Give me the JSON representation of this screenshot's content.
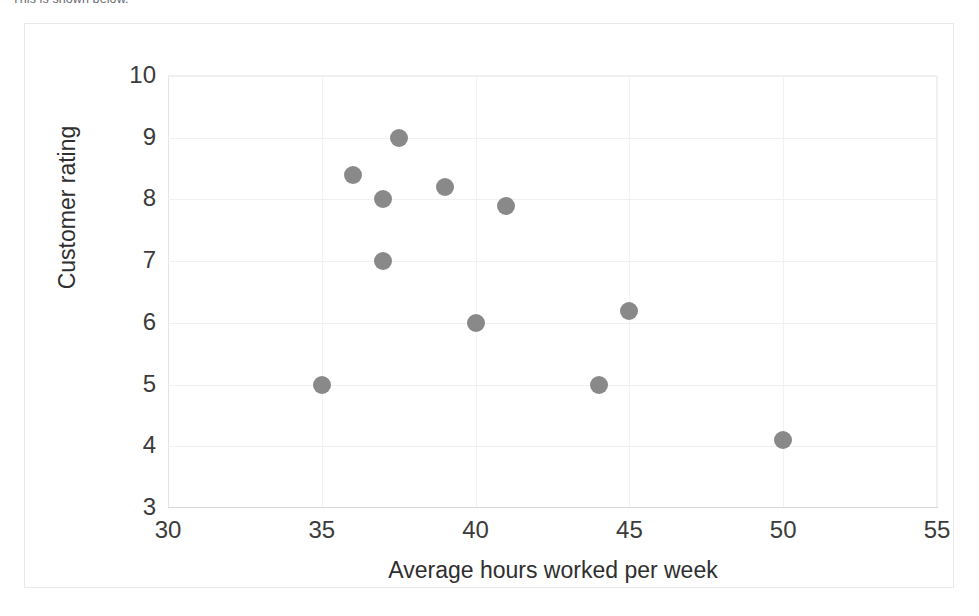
{
  "page": {
    "top_caption": "This is shown below."
  },
  "chart_data": {
    "type": "scatter",
    "title": "",
    "xlabel": "Average hours worked per week",
    "ylabel": "Customer rating",
    "xlim": [
      30,
      55
    ],
    "ylim": [
      3,
      10
    ],
    "xticks": [
      30,
      35,
      40,
      45,
      50,
      55
    ],
    "yticks": [
      3,
      4,
      5,
      6,
      7,
      8,
      9,
      10
    ],
    "grid": true,
    "legend": false,
    "marker_color": "#7f7f7f",
    "series": [
      {
        "name": "Employees",
        "points": [
          {
            "x": 35,
            "y": 5.0
          },
          {
            "x": 36,
            "y": 8.4
          },
          {
            "x": 37,
            "y": 8.0
          },
          {
            "x": 37,
            "y": 7.0
          },
          {
            "x": 37.5,
            "y": 9.0
          },
          {
            "x": 39,
            "y": 8.2
          },
          {
            "x": 40,
            "y": 6.0
          },
          {
            "x": 41,
            "y": 7.9
          },
          {
            "x": 44,
            "y": 5.0
          },
          {
            "x": 45,
            "y": 6.2
          },
          {
            "x": 50,
            "y": 4.1
          }
        ]
      }
    ]
  }
}
